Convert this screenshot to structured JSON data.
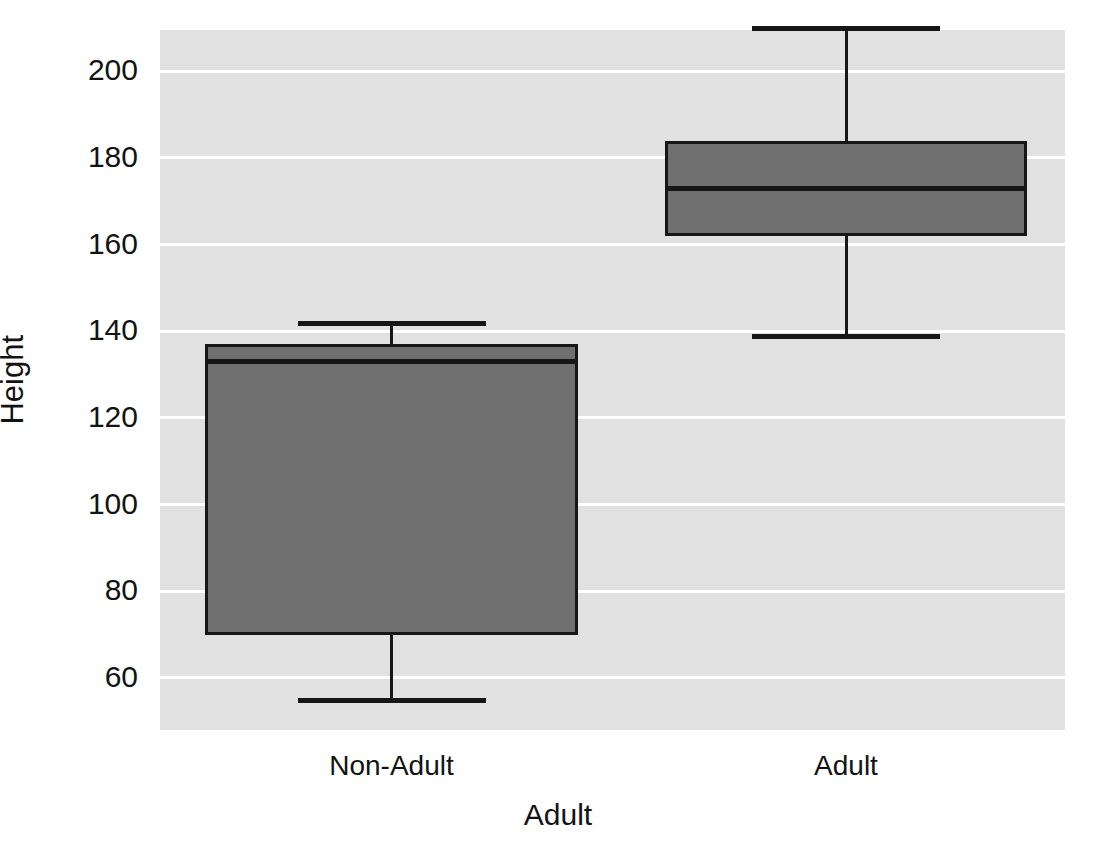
{
  "chart_data": {
    "type": "box",
    "title": "",
    "xlabel": "Adult",
    "ylabel": "Height",
    "categories": [
      "Non-Adult",
      "Adult"
    ],
    "yticks": [
      200,
      180,
      160,
      140,
      120,
      100,
      80,
      60
    ],
    "ytick_labels": [
      "200",
      "180",
      "160",
      "140",
      "120",
      "100",
      "80",
      "60"
    ],
    "ylim": [
      48,
      209.5
    ],
    "grid": "horizontal-white",
    "legend": "none",
    "boxes": [
      {
        "category": "Non-Adult",
        "whisker_low": 55,
        "q1": 70,
        "median": 133,
        "q3": 137,
        "whisker_high": 142,
        "fill_color": "#6f6f6f",
        "line_color": "#161616"
      },
      {
        "category": "Adult",
        "whisker_low": 139,
        "q1": 162,
        "median": 173,
        "q3": 184,
        "whisker_high": 210,
        "fill_color": "#6f6f6f",
        "line_color": "#161616"
      }
    ],
    "plot_background": "#e1e1e1",
    "gridline_color": "#ffffff",
    "figure_background": "#ffffff"
  }
}
